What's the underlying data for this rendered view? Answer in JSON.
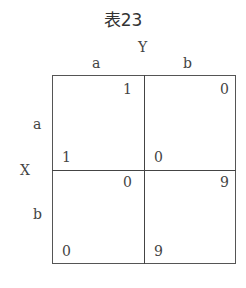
{
  "title": "表23",
  "col_player": "Y",
  "row_player": "X",
  "col_strategies": [
    "a",
    "b"
  ],
  "row_strategies": [
    "a",
    "b"
  ],
  "cells": [
    [
      {
        "y_payoff": "1",
        "x_payoff": "1"
      },
      {
        "y_payoff": "0",
        "x_payoff": "0"
      }
    ],
    [
      {
        "y_payoff": "0",
        "x_payoff": "0"
      },
      {
        "y_payoff": "9",
        "x_payoff": "9"
      }
    ]
  ]
}
